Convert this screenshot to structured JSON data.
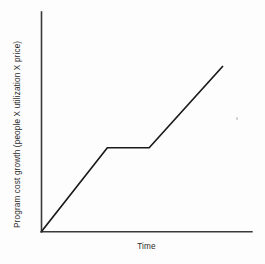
{
  "chart_data": {
    "type": "line",
    "title": "",
    "subtitle": "",
    "xlabel": "Time",
    "ylabel": "Program cost growth (people X utilization X price)",
    "x_tick_labels": [],
    "y_tick_labels": [],
    "grid": false,
    "legend": null,
    "legend_position": "none",
    "xlim": [
      0,
      100
    ],
    "ylim": [
      0,
      100
    ],
    "annotations": [],
    "series": [
      {
        "name": "Program cost growth",
        "color": "#1a1a1a",
        "x": [
          0,
          31.3,
          51.2,
          86.3
        ],
        "y": [
          0,
          38.2,
          38.2,
          75.5
        ],
        "points_description": [
          "origin at zero growth",
          "rise to first plateau level",
          "flat plateau (no growth)",
          "resumed rise to final level"
        ]
      }
    ]
  },
  "axes": {
    "y_axis_name": "vertical-axis-line",
    "x_axis_name": "horizontal-axis-line",
    "axis_color": "#3a3a3a"
  },
  "artifacts": {
    "scan_speck_label": ""
  }
}
